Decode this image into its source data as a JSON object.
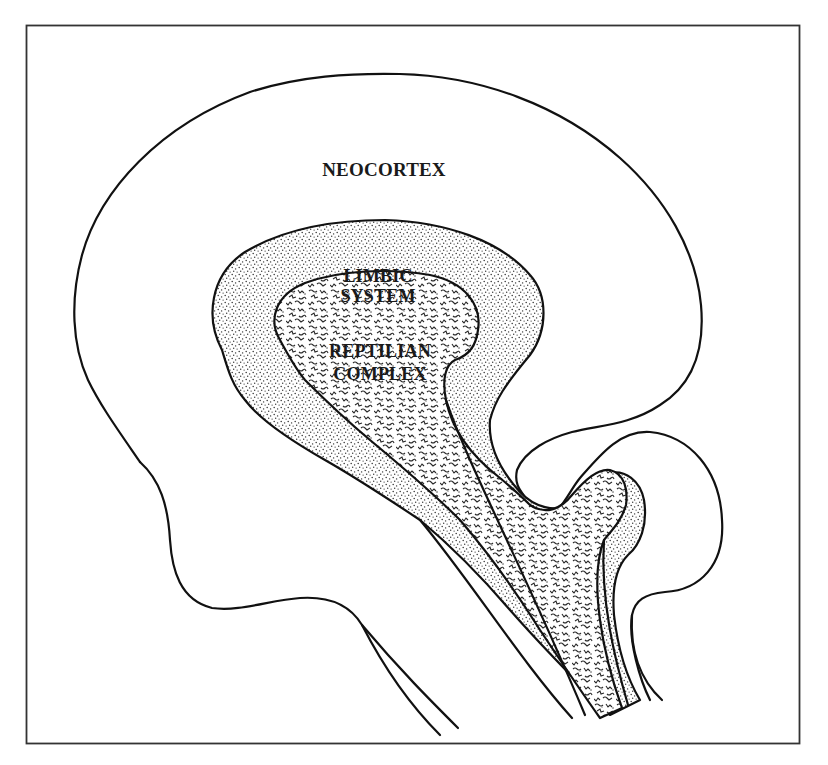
{
  "figure": {
    "type": "triune-brain-diagram",
    "colors": {
      "background": "#ffffff",
      "line": "#111111",
      "frame": "#333333",
      "label": "#1a1a1a"
    },
    "regions": [
      {
        "id": "neocortex",
        "label_lines": [
          "NEOCORTEX"
        ],
        "fill": "none"
      },
      {
        "id": "limbic-system",
        "label_lines": [
          "LIMBIC",
          "SYSTEM"
        ],
        "fill": "fine-stipple"
      },
      {
        "id": "reptilian-complex",
        "label_lines": [
          "REPTILIAN",
          "COMPLEX"
        ],
        "fill": "squiggle-texture"
      }
    ]
  },
  "labels": {
    "neocortex": "NEOCORTEX",
    "limbic_1": "LIMBIC",
    "limbic_2": "SYSTEM",
    "reptilian_1": "REPTILIAN",
    "reptilian_2": "COMPLEX"
  }
}
